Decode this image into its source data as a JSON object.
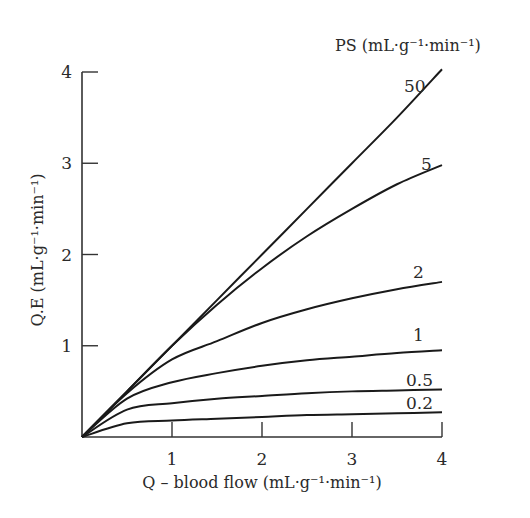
{
  "chart_data": {
    "type": "line",
    "title": "",
    "legend_title": "PS (mL·g⁻¹·min⁻¹)",
    "xlabel": "Q – blood flow (mL·g⁻¹·min⁻¹)",
    "ylabel": "Q.E (mL·g⁻¹·min⁻¹)",
    "xlim": [
      0,
      4
    ],
    "ylim": [
      0,
      4
    ],
    "x_ticks": [
      "1",
      "2",
      "3",
      "4"
    ],
    "y_ticks": [
      "1",
      "2",
      "3",
      "4"
    ],
    "grid": false,
    "x": [
      0,
      0.5,
      1,
      1.5,
      2,
      2.5,
      3,
      3.5,
      4
    ],
    "series": [
      {
        "name": "50",
        "values": [
          0,
          0.5,
          1.0,
          1.5,
          2.0,
          2.5,
          3.0,
          3.5,
          4.03
        ]
      },
      {
        "name": "5",
        "values": [
          0,
          0.5,
          1.0,
          1.45,
          1.85,
          2.2,
          2.5,
          2.77,
          2.98
        ]
      },
      {
        "name": "2",
        "values": [
          0,
          0.48,
          0.85,
          1.05,
          1.25,
          1.4,
          1.52,
          1.62,
          1.7
        ]
      },
      {
        "name": "1",
        "values": [
          0,
          0.42,
          0.6,
          0.7,
          0.78,
          0.84,
          0.88,
          0.92,
          0.95
        ]
      },
      {
        "name": "0.5",
        "values": [
          0,
          0.3,
          0.37,
          0.42,
          0.45,
          0.48,
          0.5,
          0.51,
          0.52
        ]
      },
      {
        "name": "0.2",
        "values": [
          0,
          0.15,
          0.18,
          0.2,
          0.22,
          0.24,
          0.25,
          0.26,
          0.27
        ]
      }
    ],
    "line_color": "#1a1a1a"
  }
}
